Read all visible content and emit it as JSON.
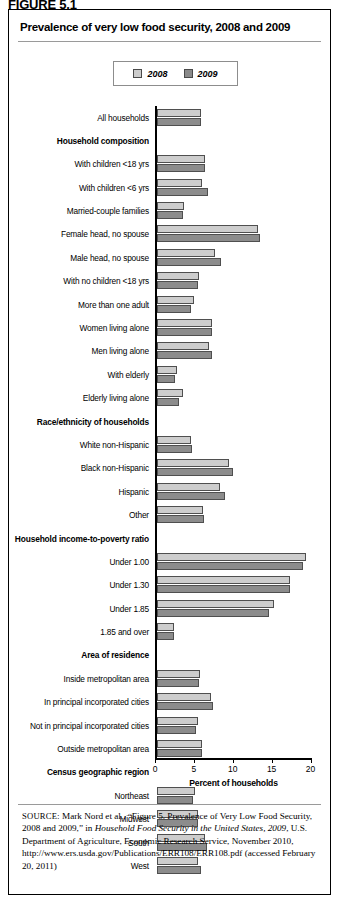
{
  "figure": {
    "caption": "FIGURE 5.1",
    "title": "Prevalence of very low food security, 2008 and 2009"
  },
  "legend": {
    "position": "top-center",
    "items": [
      {
        "label": "2008",
        "color": "#cdcdcd"
      },
      {
        "label": "2009",
        "color": "#8c8c8c"
      }
    ]
  },
  "axis": {
    "xlabel": "Percent of households",
    "ticks": [
      "0",
      "5",
      "10",
      "15",
      "20"
    ]
  },
  "source": {
    "prefix": "SOURCE",
    "part1": ": Mark Nord et al., “Figure 5. Prevalence of Very Low Food Security, 2008 and 2009,” in ",
    "italic1": "Household Food Security in the United States, 2009",
    "part2": ", U.S. Department of Agriculture, Economic Research Service, November 2010, http://www.ers.usda.gov/Publications/ERR108/ERR108.pdf (accessed February 20, 2011)"
  },
  "chart_data": {
    "type": "bar",
    "orientation": "horizontal",
    "title": "Prevalence of very low food security, 2008 and 2009",
    "xlabel": "Percent of households",
    "ylabel": "",
    "xlim": [
      0,
      20
    ],
    "grid": false,
    "legend_position": "top-center",
    "categories": [
      "All households",
      "Household composition",
      "With children <18 yrs",
      "With children <6 yrs",
      "Married-couple families",
      "Female head, no spouse",
      "Male head, no spouse",
      "With no children <18 yrs",
      "More than one adult",
      "Women living alone",
      "Men living alone",
      "With elderly",
      "Elderly living alone",
      "Race/ethnicity of households",
      "White non-Hispanic",
      "Black non-Hispanic",
      "Hispanic",
      "Other",
      "Household income-to-poverty ratio",
      "Under 1.00",
      "Under 1.30",
      "Under 1.85",
      "1.85 and over",
      "Area of residence",
      "Inside metropolitan area",
      "In principal incorporated cities",
      "Not in principal incorporated cities",
      "Outside metropolitan area",
      "Census geographic region",
      "Northeast",
      "Midwest",
      "South",
      "West"
    ],
    "header_rows": [
      "Household composition",
      "Race/ethnicity of households",
      "Household income-to-poverty ratio",
      "Area of residence",
      "Census geographic region"
    ],
    "series": [
      {
        "name": "2008",
        "color": "#cdcdcd",
        "values": [
          5.7,
          null,
          6.2,
          5.8,
          3.6,
          13.1,
          7.5,
          5.5,
          4.8,
          7.2,
          6.8,
          2.7,
          3.4,
          null,
          4.5,
          9.3,
          8.2,
          6.0,
          null,
          19.2,
          17.2,
          15.1,
          2.2,
          null,
          5.6,
          7.0,
          5.3,
          5.9,
          null,
          4.9,
          5.3,
          6.3,
          5.4
        ]
      },
      {
        "name": "2009",
        "color": "#8c8c8c",
        "values": [
          5.7,
          null,
          6.2,
          6.6,
          3.4,
          13.3,
          8.3,
          5.4,
          4.5,
          7.2,
          7.2,
          2.4,
          2.9,
          null,
          4.6,
          9.8,
          8.8,
          6.1,
          null,
          18.8,
          17.2,
          14.5,
          2.3,
          null,
          5.5,
          7.3,
          5.1,
          5.9,
          null,
          4.7,
          5.4,
          6.5,
          5.7
        ]
      }
    ]
  }
}
